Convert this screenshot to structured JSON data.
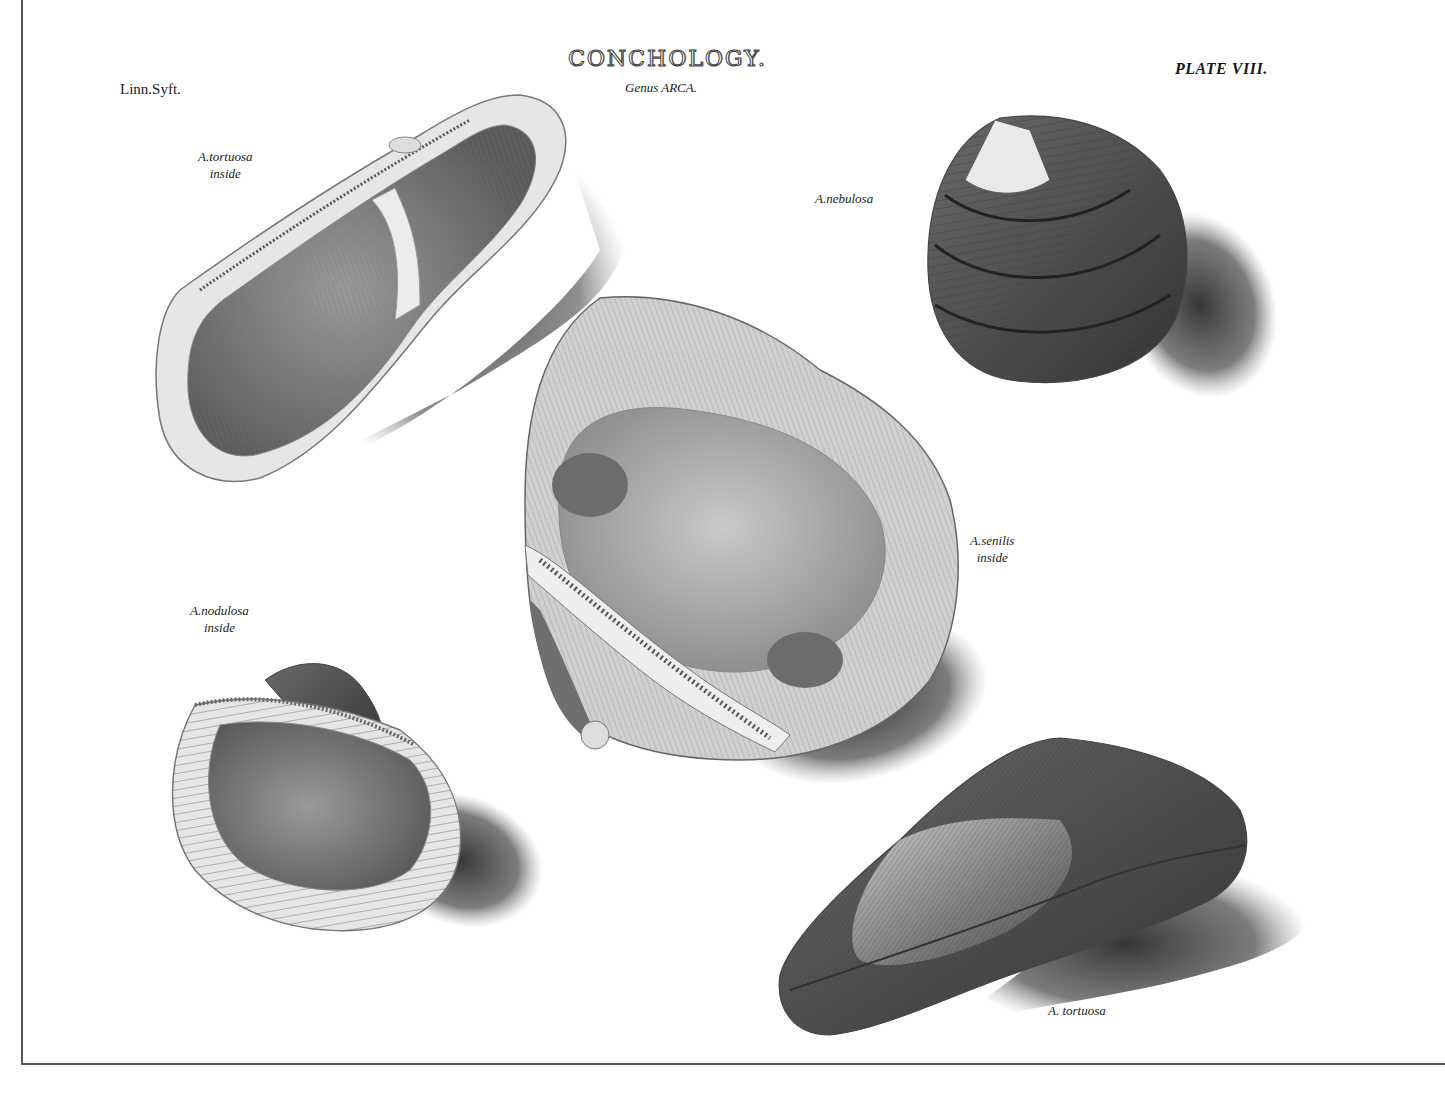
{
  "plate": {
    "title": "CONCHOLOGY.",
    "subtitle": "Genus ARCA.",
    "plate_number": "PLATE VIII.",
    "system_note": "Linn.Syft."
  },
  "specimens": [
    {
      "id": "a-tortuosa-inside",
      "label_line1": "A.tortuosa",
      "label_line2": "inside",
      "view": "inside"
    },
    {
      "id": "a-nebulosa",
      "label_line1": "A.nebulosa",
      "label_line2": "",
      "view": "outside"
    },
    {
      "id": "a-senilis-inside",
      "label_line1": "A.senilis",
      "label_line2": "inside",
      "view": "inside"
    },
    {
      "id": "a-nodulosa-inside",
      "label_line1": "A.nodulosa",
      "label_line2": "inside",
      "view": "inside"
    },
    {
      "id": "a-tortuosa",
      "label_line1": "A. tortuosa",
      "label_line2": "",
      "view": "outside"
    }
  ],
  "colors": {
    "paper": "#ffffff",
    "ink": "#1a1a1a",
    "border": "#555555",
    "shadow": "#3a3a3a"
  }
}
